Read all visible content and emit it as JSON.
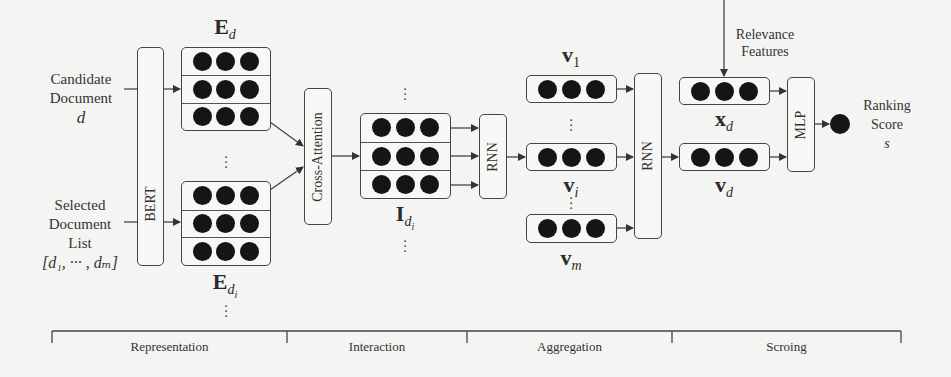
{
  "inputs": {
    "candidate": {
      "line1": "Candidate",
      "line2": "Document",
      "var": "d"
    },
    "selected": {
      "line1": "Selected",
      "line2": "Document",
      "line3": "List",
      "var": "[d₁, ··· , dₘ]"
    }
  },
  "modules": {
    "bert": "BERT",
    "cross_attention": "Cross-Attention",
    "rnn1": "RNN",
    "rnn2": "RNN",
    "mlp": "MLP"
  },
  "matrices": {
    "e_d": {
      "symbol": "E",
      "sub": "d"
    },
    "e_di": {
      "symbol": "E",
      "sub": "d",
      "subsub": "i"
    },
    "i_di": {
      "symbol": "I",
      "sub": "d",
      "subsub": "i"
    }
  },
  "vectors": {
    "v1": {
      "symbol": "v",
      "sub": "1"
    },
    "vi": {
      "symbol": "v",
      "sub": "i"
    },
    "vm": {
      "symbol": "v",
      "sub": "m"
    },
    "xd": {
      "symbol": "x",
      "sub": "d"
    },
    "vd": {
      "symbol": "v",
      "sub": "d"
    }
  },
  "relevance": {
    "line1": "Relevance",
    "line2": "Features"
  },
  "output": {
    "line1": "Ranking",
    "line2": "Score",
    "var": "s"
  },
  "stages": [
    {
      "label": "Representation"
    },
    {
      "label": "Interaction"
    },
    {
      "label": "Aggregation"
    },
    {
      "label": "Scroing"
    }
  ],
  "colors": {
    "line": "#444444",
    "dot": "#151515",
    "background": "#f4f4f2"
  }
}
